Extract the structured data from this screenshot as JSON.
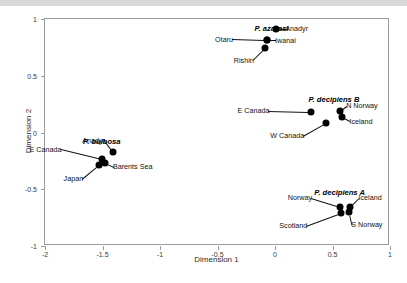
{
  "chart_data": {
    "type": "scatter",
    "title": "",
    "xlabel": "Dimension 1",
    "ylabel": "Dimension 2",
    "xlim": [
      -2,
      1
    ],
    "ylim": [
      -1,
      1
    ],
    "xticks": [
      "-2",
      "-1.5",
      "-1",
      "-0.5",
      "0",
      "0.5",
      "1"
    ],
    "xtick_values": [
      -2,
      -1.5,
      -1,
      -0.5,
      0,
      0.5,
      1
    ],
    "yticks": [
      "-1",
      "-0.5",
      "0",
      "0.5",
      "1"
    ],
    "ytick_values": [
      -1,
      -0.5,
      0,
      0.5,
      1
    ],
    "grid": false,
    "legend": false,
    "marker": "filled-circle",
    "marker_color": "#000000",
    "groups": [
      {
        "name": "P. azarasi",
        "label_x": -0.17,
        "label_y": 0.9,
        "points": [
          {
            "label": "Anadyr",
            "x": 0.02,
            "y": 0.905,
            "label_dx": 9,
            "label_dy": 0
          },
          {
            "label": "Iwanai",
            "x": -0.06,
            "y": 0.805,
            "label_dx": 8,
            "label_dy": 0
          },
          {
            "label": "Otaru",
            "x": -0.06,
            "y": 0.805,
            "label_dx": -34,
            "label_dy": -1
          },
          {
            "label": "Rishiri",
            "x": -0.08,
            "y": 0.735,
            "label_dx": -11,
            "label_dy": 12
          }
        ]
      },
      {
        "name": "P. decipiens B",
        "label_x": 0.3,
        "label_y": 0.275,
        "points": [
          {
            "label": "N Norway",
            "x": 0.575,
            "y": 0.185,
            "label_dx": 6,
            "label_dy": -5
          },
          {
            "label": "Iceland",
            "x": 0.595,
            "y": 0.125,
            "label_dx": 7,
            "label_dy": 4
          },
          {
            "label": "E Canada",
            "x": 0.325,
            "y": 0.175,
            "label_dx": -42,
            "label_dy": -1
          },
          {
            "label": "W Canada",
            "x": 0.455,
            "y": 0.075,
            "label_dx": -22,
            "label_dy": 13
          }
        ]
      },
      {
        "name": "P. bulbosa",
        "label_x": -1.66,
        "label_y": -0.095,
        "points": [
          {
            "label": "Anadyr",
            "x": -1.4,
            "y": -0.185,
            "label_dx": -8,
            "label_dy": -12
          },
          {
            "label": "E Canada",
            "x": -1.5,
            "y": -0.245,
            "label_dx": -40,
            "label_dy": -10
          },
          {
            "label": "Barents Sea",
            "x": -1.47,
            "y": -0.275,
            "label_dx": 8,
            "label_dy": 4
          },
          {
            "label": "Japan",
            "x": -1.52,
            "y": -0.295,
            "label_dx": -16,
            "label_dy": 14
          }
        ]
      },
      {
        "name": "P. decipiens A",
        "label_x": 0.35,
        "label_y": -0.545,
        "points": [
          {
            "label": "Norway",
            "x": 0.575,
            "y": -0.665,
            "label_dx": -28,
            "label_dy": -9
          },
          {
            "label": "Iceland",
            "x": 0.665,
            "y": -0.665,
            "label_dx": 8,
            "label_dy": -9
          },
          {
            "label": "S Norway",
            "x": 0.655,
            "y": -0.705,
            "label_dx": 2,
            "label_dy": 13
          },
          {
            "label": "Scotland",
            "x": 0.585,
            "y": -0.715,
            "label_dx": -34,
            "label_dy": 13
          }
        ]
      }
    ]
  }
}
